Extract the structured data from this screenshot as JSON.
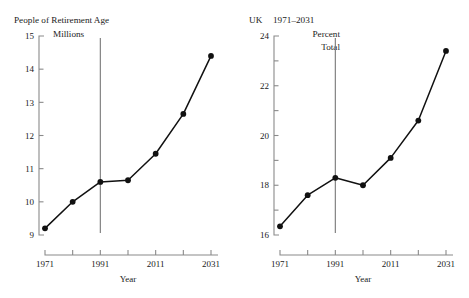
{
  "chart_data": [
    {
      "type": "line",
      "id": "people-of-retirement-age",
      "title": "People of Retirement Age",
      "unit_label_line1": "Millions",
      "unit_label_line2": "",
      "xlabel": "Year",
      "ylabel": "",
      "x": [
        1971,
        1981,
        1991,
        2001,
        2011,
        2021,
        2031
      ],
      "values": [
        9.2,
        10.0,
        10.6,
        10.65,
        11.45,
        12.65,
        14.4
      ],
      "ylim": [
        9,
        15
      ],
      "xlim": [
        1971,
        2031
      ],
      "ytick_values": [
        9,
        10,
        11,
        12,
        13,
        14,
        15
      ],
      "ytick_labels": [
        "9",
        "10",
        "11",
        "12",
        "13",
        "14",
        "15"
      ],
      "yminor_values": [],
      "xtick_values": [
        1971,
        1981,
        1991,
        2001,
        2011,
        2021,
        2031
      ],
      "xtick_labels": [
        "1971",
        "",
        "1991",
        "",
        "2011",
        "",
        "2031"
      ],
      "annotation_line_x": 1991,
      "grid": false,
      "legend": "none",
      "marker": "filled-circle",
      "line_color": "#111111",
      "axis_color": "#8a8a8a"
    },
    {
      "type": "line",
      "id": "uk-percent-total",
      "title": "UK  1971–2031",
      "title_prefix": "UK",
      "title_range": "1971–2031",
      "unit_label_line1": "Percent",
      "unit_label_line2": "Total",
      "xlabel": "Year",
      "ylabel": "",
      "x": [
        1971,
        1981,
        1991,
        2001,
        2011,
        2021,
        2031
      ],
      "values": [
        16.35,
        17.6,
        18.3,
        18.0,
        19.1,
        20.6,
        23.4
      ],
      "ylim": [
        16,
        24
      ],
      "xlim": [
        1971,
        2031
      ],
      "ytick_values": [
        16,
        18,
        20,
        22,
        24
      ],
      "ytick_labels": [
        "16",
        "18",
        "20",
        "22",
        "24"
      ],
      "yminor_values": [
        17,
        19,
        21,
        23
      ],
      "xtick_values": [
        1971,
        1981,
        1991,
        2001,
        2011,
        2021,
        2031
      ],
      "xtick_labels": [
        "1971",
        "",
        "1991",
        "",
        "2011",
        "",
        "2031"
      ],
      "annotation_line_x": 1991,
      "grid": false,
      "legend": "none",
      "marker": "filled-circle",
      "line_color": "#111111",
      "axis_color": "#8a8a8a"
    }
  ]
}
